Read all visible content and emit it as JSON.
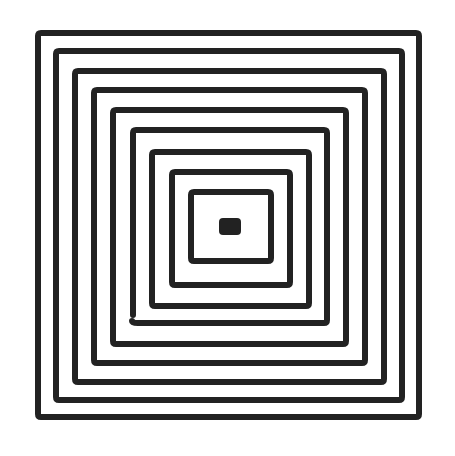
{
  "figure": {
    "stroke_color": "#222222",
    "background_color": "#ffffff",
    "stroke_width": 6,
    "squares": [
      {
        "x1": 38,
        "y1": 33,
        "x2": 419,
        "y2": 417
      },
      {
        "x1": 56,
        "y1": 51,
        "x2": 402,
        "y2": 400
      },
      {
        "x1": 75,
        "y1": 71,
        "x2": 384,
        "y2": 382
      },
      {
        "x1": 94,
        "y1": 90,
        "x2": 365,
        "y2": 363
      },
      {
        "x1": 113,
        "y1": 110,
        "x2": 346,
        "y2": 344
      },
      {
        "x1": 133,
        "y1": 130,
        "x2": 327,
        "y2": 323,
        "gap": "bottom-left"
      },
      {
        "x1": 152,
        "y1": 152,
        "x2": 309,
        "y2": 306
      },
      {
        "x1": 172,
        "y1": 172,
        "x2": 290,
        "y2": 285
      },
      {
        "x1": 191,
        "y1": 192,
        "x2": 271,
        "y2": 261
      }
    ],
    "center_dot": {
      "x1": 219,
      "y1": 218,
      "x2": 241,
      "y2": 235
    }
  }
}
